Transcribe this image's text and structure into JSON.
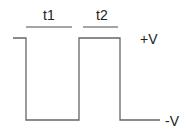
{
  "diagram": {
    "type": "square-wave",
    "labels": {
      "t1": "t1",
      "t2": "t2",
      "high": "+V",
      "low": "-V"
    },
    "colors": {
      "line": "#666666",
      "text": "#222222"
    }
  }
}
